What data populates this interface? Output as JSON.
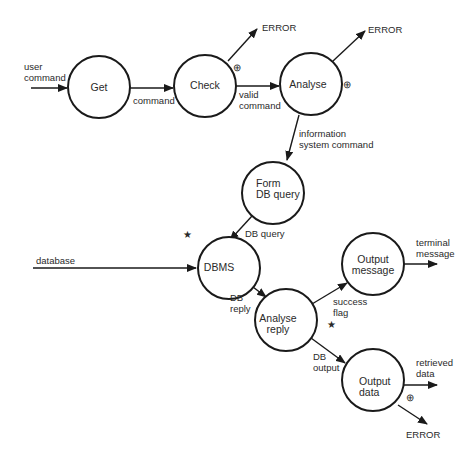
{
  "diagram": {
    "type": "data-flow-diagram",
    "processes": [
      {
        "id": "get",
        "label": [
          "Get"
        ],
        "cx": 99,
        "cy": 87,
        "r": 31
      },
      {
        "id": "check",
        "label": [
          "Check"
        ],
        "cx": 205,
        "cy": 86,
        "r": 31
      },
      {
        "id": "analyse",
        "label": [
          "Analyse"
        ],
        "cx": 311,
        "cy": 84,
        "r": 31
      },
      {
        "id": "form_db_query",
        "label": [
          "Form",
          "DB query"
        ],
        "cx": 273,
        "cy": 193,
        "r": 31
      },
      {
        "id": "dbms",
        "label": [
          "DBMS"
        ],
        "cx": 229,
        "cy": 268,
        "r": 31
      },
      {
        "id": "analyse_reply",
        "label": [
          "Analyse",
          "reply"
        ],
        "cx": 286,
        "cy": 320,
        "r": 31
      },
      {
        "id": "output_message",
        "label": [
          "Output",
          "message"
        ],
        "cx": 373,
        "cy": 264,
        "r": 31
      },
      {
        "id": "output_data",
        "label": [
          "Output",
          "data"
        ],
        "cx": 373,
        "cy": 380,
        "r": 31
      }
    ],
    "flows": [
      {
        "id": "user_command",
        "label": [
          "user",
          "command"
        ]
      },
      {
        "id": "command",
        "label": [
          "command"
        ]
      },
      {
        "id": "check_error",
        "label": [
          "ERROR"
        ]
      },
      {
        "id": "valid_command",
        "label": [
          "valid",
          "command"
        ]
      },
      {
        "id": "analyse_error",
        "label": [
          "ERROR"
        ]
      },
      {
        "id": "information_system_command",
        "label": [
          "information",
          "system command"
        ]
      },
      {
        "id": "db_query",
        "label": [
          "DB query"
        ]
      },
      {
        "id": "database",
        "label": [
          "database"
        ]
      },
      {
        "id": "db_reply",
        "label": [
          "DB",
          "reply"
        ]
      },
      {
        "id": "success_flag",
        "label": [
          "success",
          "flag"
        ]
      },
      {
        "id": "terminal_message",
        "label": [
          "terminal",
          "message"
        ]
      },
      {
        "id": "db_output",
        "label": [
          "DB",
          "output"
        ]
      },
      {
        "id": "retrieved_data",
        "label": [
          "retrieved",
          "data"
        ]
      },
      {
        "id": "output_error",
        "label": [
          "ERROR"
        ]
      }
    ],
    "symbols": {
      "exclusive_or": "⊕",
      "star": "★"
    },
    "colors": {
      "stroke": "#1a1a1a",
      "text": "#2a2a2a",
      "background": "#ffffff"
    }
  }
}
